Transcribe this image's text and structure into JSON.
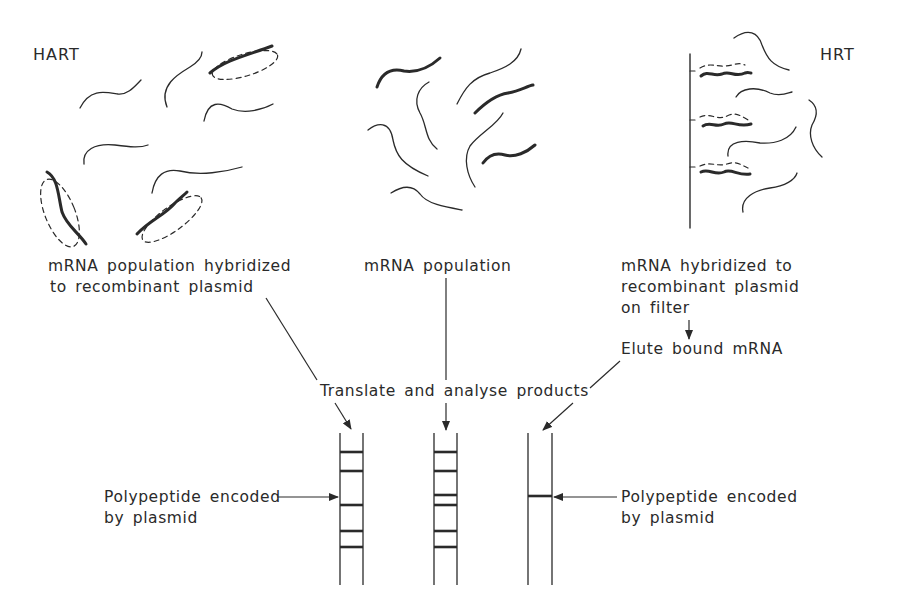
{
  "panels": {
    "hart": {
      "title": "HART",
      "caption_lines": [
        "mRNA population hybridized",
        "to recombinant plasmid"
      ]
    },
    "population": {
      "caption": "mRNA population"
    },
    "hrt": {
      "title": "HRT",
      "caption_lines": [
        "mRNA hybridized to",
        "recombinant plasmid",
        "on filter"
      ],
      "step": "Elute bound mRNA"
    }
  },
  "center_step": "Translate and analyse products",
  "gel": {
    "lanes": [
      {
        "id": "hart-lane",
        "band_count": 5
      },
      {
        "id": "population-lane",
        "band_count": 6
      },
      {
        "id": "hrt-lane",
        "band_count": 1
      }
    ],
    "left_annotation": [
      "Polypeptide encoded",
      "by plasmid"
    ],
    "right_annotation": [
      "Polypeptide encoded",
      "by plasmid"
    ]
  },
  "colors": {
    "ink": "#2a2a2a",
    "background": "#ffffff"
  }
}
